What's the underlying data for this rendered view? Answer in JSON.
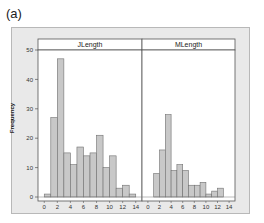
{
  "figure_label": "(a)",
  "chart_data": {
    "type": "bar",
    "title": "",
    "ylabel": "Frequency",
    "xlabel": "",
    "ylim": [
      0,
      52
    ],
    "yticks": [
      0,
      10,
      20,
      30,
      40,
      50
    ],
    "xticks": [
      0,
      2,
      4,
      6,
      8,
      10,
      12,
      14
    ],
    "xlim": [
      -0.5,
      14.5
    ],
    "grid": false,
    "bar_color": "#c8c8c8",
    "bar_edge_color": "#707070",
    "bin_width": 1,
    "bin_starts": [
      0,
      1,
      2,
      3,
      4,
      5,
      6,
      7,
      8,
      9,
      10,
      11,
      12,
      13
    ],
    "panels": [
      {
        "name": "JLength",
        "values": [
          1,
          27,
          47,
          15,
          11,
          17,
          14,
          15,
          21,
          10,
          14,
          3,
          4,
          1
        ]
      },
      {
        "name": "MLength",
        "values": [
          0,
          8,
          16,
          28,
          9,
          11,
          9,
          4,
          4,
          5,
          1,
          2,
          3,
          0
        ]
      }
    ]
  }
}
